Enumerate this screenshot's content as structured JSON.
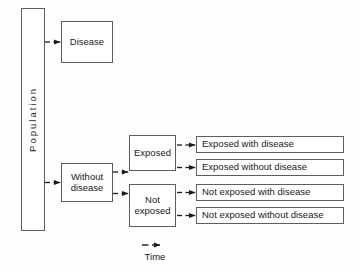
{
  "diagram": {
    "colors": {
      "box_border": "#5d5d5d",
      "box_fill": "#ffffff",
      "connector": "#1a1a1a",
      "text": "#1a1a1a",
      "background": "#fdfdfd"
    },
    "nodes": {
      "population": {
        "label": "Population",
        "orientation": "vertical"
      },
      "disease": {
        "label": "Disease"
      },
      "without_disease": {
        "label": "Without disease",
        "line1": "Without",
        "line2": "disease"
      },
      "exposed": {
        "label": "Exposed"
      },
      "not_exposed": {
        "label": "Not exposed",
        "line1": "Not",
        "line2": "exposed"
      }
    },
    "outcomes": [
      {
        "id": "exposed-with-disease",
        "label": "Exposed with disease"
      },
      {
        "id": "exposed-without-disease",
        "label": "Exposed without disease"
      },
      {
        "id": "not-exposed-with-disease",
        "label": "Not exposed with disease"
      },
      {
        "id": "not-exposed-without-disease",
        "label": "Not exposed without disease"
      }
    ],
    "legend": {
      "label": "Time",
      "arrow_icon": "dashed-right-arrow-icon"
    },
    "edges": [
      {
        "from": "population",
        "to": "disease",
        "style": "dashed-arrow"
      },
      {
        "from": "population",
        "to": "without_disease",
        "style": "dashed-arrow"
      },
      {
        "from": "without_disease",
        "to": "exposed",
        "style": "branch-arrow"
      },
      {
        "from": "without_disease",
        "to": "not_exposed",
        "style": "branch-arrow"
      },
      {
        "from": "exposed",
        "to": "exposed-with-disease",
        "style": "branch-arrow"
      },
      {
        "from": "exposed",
        "to": "exposed-without-disease",
        "style": "branch-arrow"
      },
      {
        "from": "not_exposed",
        "to": "not-exposed-with-disease",
        "style": "branch-arrow"
      },
      {
        "from": "not_exposed",
        "to": "not-exposed-without-disease",
        "style": "branch-arrow"
      }
    ]
  }
}
